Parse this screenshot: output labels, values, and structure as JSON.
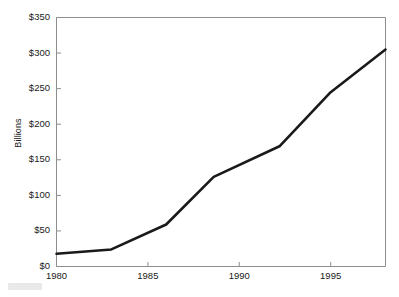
{
  "chart_data": {
    "type": "line",
    "title": "",
    "xlabel": "",
    "ylabel": "Billions",
    "xlim": [
      1980,
      1998
    ],
    "ylim": [
      0,
      350
    ],
    "grid": false,
    "legend": null,
    "y_tick_values": [
      0,
      50,
      100,
      150,
      200,
      250,
      300,
      350
    ],
    "y_tick_labels": [
      "$0",
      "$50",
      "$100",
      "$150",
      "$200",
      "$250",
      "$300",
      "$350"
    ],
    "x_tick_values": [
      1980,
      1985,
      1990,
      1995
    ],
    "x_tick_labels": [
      "1980",
      "1985",
      "1990",
      "1995"
    ],
    "series": [
      {
        "name": "Billions",
        "color": "#1a1a1a",
        "line_width": 2.6,
        "x": [
          1980,
          1983,
          1986,
          1988.6,
          1992.2,
          1995,
          1998
        ],
        "values": [
          18,
          24,
          59,
          126,
          169,
          245,
          305
        ]
      }
    ]
  },
  "axes": {
    "y_label": "Billions",
    "y_ticks": [
      "$350",
      "$300",
      "$250",
      "$200",
      "$150",
      "$100",
      "$50",
      "$0"
    ],
    "x_ticks": [
      "1980",
      "1985",
      "1990",
      "1995"
    ]
  }
}
